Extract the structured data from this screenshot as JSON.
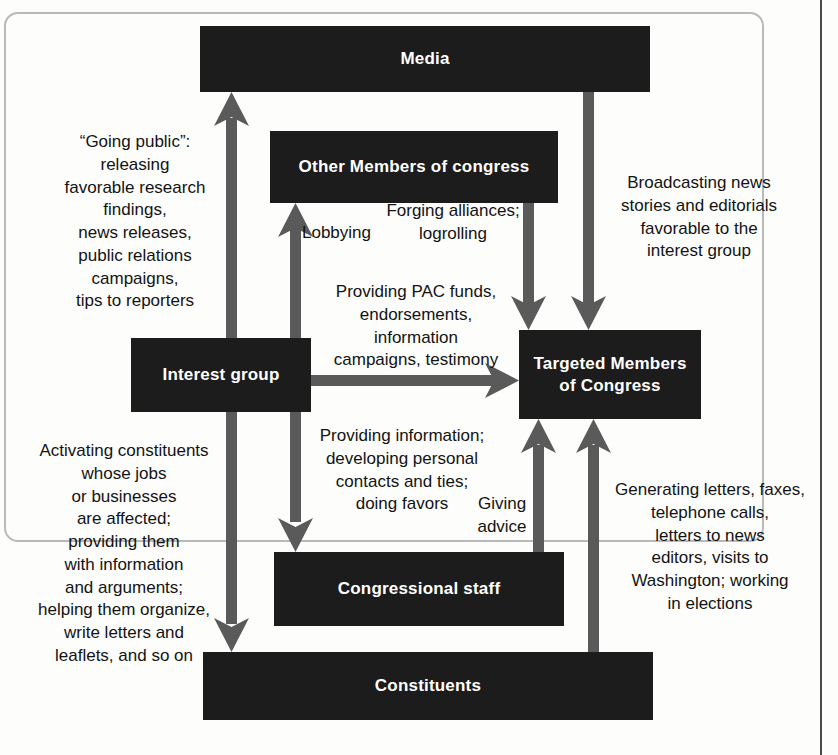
{
  "diagram": {
    "colors": {
      "node_fill": "#1c1c1c",
      "node_text": "#ffffff",
      "arrow": "#5a5a5a",
      "page_text": "#131313",
      "frame": "#b9b9b9",
      "rule": "#4a4a4a"
    },
    "nodes": [
      {
        "id": "media",
        "label": "Media"
      },
      {
        "id": "other",
        "label": "Other Members\nof congress"
      },
      {
        "id": "interest",
        "label": "Interest\ngroup"
      },
      {
        "id": "targeted",
        "label": "Targeted Members\nof Congress"
      },
      {
        "id": "staff",
        "label": "Congressional\nstaff"
      },
      {
        "id": "const",
        "label": "Constituents"
      }
    ],
    "notes": [
      {
        "id": "going-public",
        "text": "“Going public”:\nreleasing\nfavorable research\nfindings,\nnews releases,\npublic relations\ncampaigns,\ntips to reporters"
      },
      {
        "id": "lobbying",
        "text": "Lobbying"
      },
      {
        "id": "forging",
        "text": "Forging alliances;\nlogrolling"
      },
      {
        "id": "broadcasting",
        "text": "Broadcasting news\nstories and editorials\nfavorable to the\ninterest group"
      },
      {
        "id": "pac-funds",
        "text": "Providing PAC funds,\nendorsements,\ninformation\ncampaigns, testimony"
      },
      {
        "id": "activating",
        "text": "Activating constituents\nwhose jobs\nor businesses\nare affected;\nproviding them\nwith information\nand arguments;\nhelping them organize,\nwrite letters and\nleaflets, and so on"
      },
      {
        "id": "providing-info",
        "text": "Providing information;\ndeveloping personal\ncontacts and ties;\ndoing favors"
      },
      {
        "id": "giving-advice",
        "text": "Giving\nadvice"
      },
      {
        "id": "generating",
        "text": "Generating letters, faxes,\ntelephone calls,\nletters to news\neditors, visits to\nWashington; working\nin elections"
      }
    ],
    "edges": [
      {
        "id": "interest-to-media",
        "from": "interest",
        "to": "media",
        "direction": "up",
        "label": "going-public"
      },
      {
        "id": "interest-to-other",
        "from": "interest",
        "to": "other",
        "direction": "up",
        "label": "lobbying"
      },
      {
        "id": "other-to-targeted",
        "from": "other",
        "to": "targeted",
        "direction": "down",
        "label": "forging"
      },
      {
        "id": "media-to-targeted",
        "from": "media",
        "to": "targeted",
        "direction": "down",
        "label": "broadcasting"
      },
      {
        "id": "interest-to-targeted",
        "from": "interest",
        "to": "targeted",
        "direction": "right",
        "label": "pac-funds"
      },
      {
        "id": "interest-to-const",
        "from": "interest",
        "to": "const",
        "direction": "down",
        "label": "activating"
      },
      {
        "id": "interest-to-staff",
        "from": "interest",
        "to": "staff",
        "direction": "down",
        "label": "providing-info"
      },
      {
        "id": "staff-to-targeted",
        "from": "staff",
        "to": "targeted",
        "direction": "up",
        "label": "giving-advice"
      },
      {
        "id": "const-to-targeted",
        "from": "const",
        "to": "targeted",
        "direction": "up",
        "label": "generating"
      }
    ]
  }
}
